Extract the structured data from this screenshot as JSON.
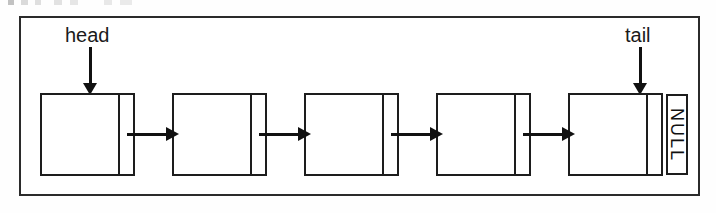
{
  "figure": {
    "type": "singly-linked-list-diagram",
    "caption_fragment_top": "",
    "pointers": [
      {
        "label": "head",
        "target_node_index": 0
      },
      {
        "label": "tail",
        "target_node_index": 4
      }
    ],
    "nodes": [
      {
        "index": 0,
        "data_value": "",
        "next_pointer": "link-to-node-1"
      },
      {
        "index": 1,
        "data_value": "",
        "next_pointer": "link-to-node-2"
      },
      {
        "index": 2,
        "data_value": "",
        "next_pointer": "link-to-node-3"
      },
      {
        "index": 3,
        "data_value": "",
        "next_pointer": "link-to-node-4"
      },
      {
        "index": 4,
        "data_value": "",
        "next_pointer": "NULL"
      }
    ],
    "terminator": {
      "label": "NULL",
      "orientation": "vertical"
    },
    "links": [
      {
        "from": 0,
        "to": 1,
        "glyph": "right-arrow"
      },
      {
        "from": 1,
        "to": 2,
        "glyph": "right-arrow"
      },
      {
        "from": 2,
        "to": 3,
        "glyph": "right-arrow"
      },
      {
        "from": 3,
        "to": 4,
        "glyph": "right-arrow"
      }
    ],
    "colors": {
      "ink": "#1d1d1d",
      "arrow": "#111111",
      "paper": "#ffffff",
      "frame": "#2b2b2b"
    }
  }
}
